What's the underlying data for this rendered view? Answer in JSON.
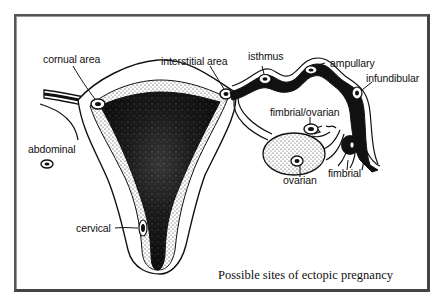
{
  "figure": {
    "caption": "Possible sites of ectopic pregnancy",
    "labels": {
      "cornual": "cornual area",
      "interstitial": "interstitial area",
      "isthmus": "isthmus",
      "ampullary": "ampullary",
      "infundibular": "infundibular",
      "fimbrial_ovarian": "fimbrial/ovarian",
      "fimbrial": "fimbrial",
      "ovarian": "ovarian",
      "abdominal": "abdominal",
      "cervical": "cervical"
    },
    "colors": {
      "ink": "#111111",
      "frame": "#555555",
      "background": "#ffffff"
    }
  }
}
